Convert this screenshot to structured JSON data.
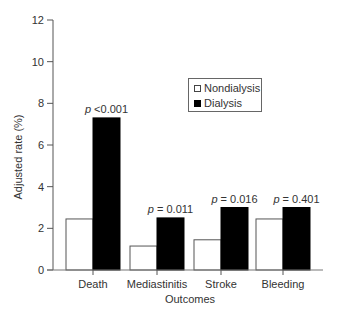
{
  "chart_data": {
    "type": "bar",
    "title": "",
    "xlabel": "Outcomes",
    "ylabel": "Adjusted rate (%)",
    "ylim": [
      0,
      12
    ],
    "yticks": [
      0,
      2,
      4,
      6,
      8,
      10,
      12
    ],
    "grid": false,
    "legend_position": "upper center (inside plot)",
    "categories": [
      "Death",
      "Mediastinitis",
      "Stroke",
      "Bleeding"
    ],
    "series": [
      {
        "name": "Nondialysis",
        "color": "#ffffff",
        "values": [
          2.45,
          1.15,
          1.45,
          2.45
        ]
      },
      {
        "name": "Dialysis",
        "color": "#000000",
        "values": [
          7.3,
          2.5,
          3.0,
          3.0
        ]
      }
    ],
    "annotations": [
      "p <0.001",
      "p = 0.011",
      "p = 0.016",
      "p = 0.401"
    ]
  },
  "legend": {
    "items": [
      {
        "label": "Nondialysis"
      },
      {
        "label": "Dialysis"
      }
    ]
  }
}
